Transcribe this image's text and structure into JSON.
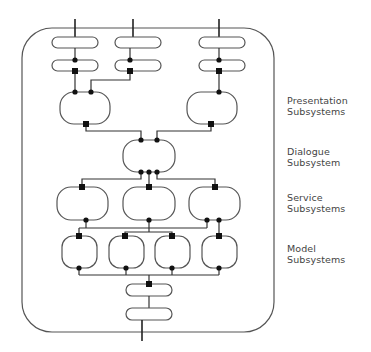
{
  "diagram": {
    "type": "architecture-layers",
    "colors": {
      "stroke": "#555555",
      "connector": "#222222",
      "background": "#ffffff",
      "text": "#444444"
    },
    "layers": [
      {
        "id": "presentation",
        "line1": "Presentation",
        "line2": "Subsystems",
        "count": 2
      },
      {
        "id": "dialogue",
        "line1": "Dialogue",
        "line2": "Subsystem",
        "count": 1
      },
      {
        "id": "service",
        "line1": "Service",
        "line2": "Subsystems",
        "count": 3
      },
      {
        "id": "model",
        "line1": "Model",
        "line2": "Subsystems",
        "count": 4
      }
    ],
    "top_inputs": 3,
    "bottom_outputs": 1,
    "connector_legend": {
      "dot": "provided-interface",
      "square": "required-interface"
    }
  }
}
